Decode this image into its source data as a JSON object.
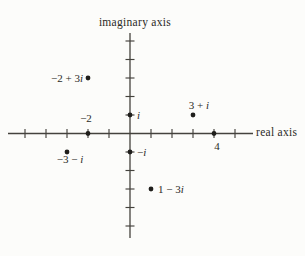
{
  "colors": {
    "paper": "#fcfcfa",
    "line": "#44423d",
    "dot": "#1f1e1b",
    "ink": "#2b2a26"
  },
  "chart_data": {
    "type": "scatter",
    "x_axis": {
      "label": "real axis",
      "range": [
        -5,
        5
      ],
      "tick_step": 1
    },
    "y_axis": {
      "label": "imaginary axis",
      "range": [
        -5,
        5
      ],
      "tick_step": 1
    },
    "points": [
      {
        "label": "−2 + 3i",
        "re": -2,
        "im": 3,
        "label_pos": "left"
      },
      {
        "label": "−2",
        "re": -2,
        "im": 0,
        "label_pos": "above"
      },
      {
        "label": "i",
        "re": 0,
        "im": 1,
        "label_pos": "right"
      },
      {
        "label": "3 + i",
        "re": 3,
        "im": 1,
        "label_pos": "above"
      },
      {
        "label": "4",
        "re": 4,
        "im": 0,
        "label_pos": "below"
      },
      {
        "label": "−3 − i",
        "re": -3,
        "im": -1,
        "label_pos": "below"
      },
      {
        "label": "−i",
        "re": 0,
        "im": -1,
        "label_pos": "right"
      },
      {
        "label": "1 − 3i",
        "re": 1,
        "im": -3,
        "label_pos": "right"
      }
    ]
  }
}
